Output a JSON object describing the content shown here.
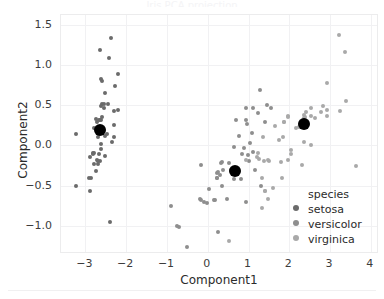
{
  "figure": {
    "title_sliver": "Iris PCA projection",
    "background": "#ffffff"
  },
  "axes": {
    "xlabel": "Component1",
    "ylabel": "Component2",
    "xticks": [
      "-3",
      "-2",
      "-1",
      "0",
      "1",
      "2",
      "3",
      "4"
    ],
    "xtick_values": [
      -3,
      -2,
      -1,
      0,
      1,
      2,
      3,
      4
    ],
    "yticks": [
      "1.5",
      "1.0",
      "0.5",
      "0.0",
      "-0.5",
      "-1.0"
    ],
    "ytick_values": [
      1.5,
      1.0,
      0.5,
      0.0,
      -0.5,
      -1.0
    ]
  },
  "legend": {
    "title": "species",
    "entries": [
      {
        "label": "setosa",
        "color": "#6b6b6b"
      },
      {
        "label": "versicolor",
        "color": "#8e8e8e"
      },
      {
        "label": "virginica",
        "color": "#a9a9a9"
      }
    ]
  },
  "chart_data": {
    "type": "scatter",
    "title": "",
    "xlabel": "Component1",
    "ylabel": "Component2",
    "xlim": [
      -3.6,
      4.2
    ],
    "ylim": [
      -1.35,
      1.62
    ],
    "grid": true,
    "legend_position": "lower right",
    "series": [
      {
        "name": "setosa",
        "color": "#6b6b6b",
        "marker_size": 4,
        "points": [
          [
            -2.68,
            0.32
          ],
          [
            -2.71,
            -0.18
          ],
          [
            -2.89,
            -0.14
          ],
          [
            -2.75,
            -0.32
          ],
          [
            -2.73,
            0.33
          ],
          [
            -2.28,
            0.74
          ],
          [
            -2.82,
            -0.09
          ],
          [
            -2.63,
            0.16
          ],
          [
            -2.89,
            -0.57
          ],
          [
            -2.67,
            -0.11
          ],
          [
            -2.51,
            0.65
          ],
          [
            -2.61,
            0.02
          ],
          [
            -2.79,
            -0.23
          ],
          [
            -3.22,
            -0.51
          ],
          [
            -2.64,
            1.19
          ],
          [
            -2.38,
            1.34
          ],
          [
            -2.62,
            0.82
          ],
          [
            -2.65,
            0.32
          ],
          [
            -2.2,
            0.89
          ],
          [
            -2.59,
            0.52
          ],
          [
            -2.31,
            0.43
          ],
          [
            -2.54,
            0.47
          ],
          [
            -3.22,
            0.14
          ],
          [
            -2.3,
            0.11
          ],
          [
            -2.36,
            0.04
          ],
          [
            -2.51,
            -0.13
          ],
          [
            -2.47,
            0.14
          ],
          [
            -2.59,
            0.35
          ],
          [
            -2.63,
            0.31
          ],
          [
            -2.65,
            -0.19
          ],
          [
            -2.69,
            -0.23
          ],
          [
            -2.2,
            0.44
          ],
          [
            -2.59,
            0.8
          ],
          [
            -2.42,
            1.09
          ],
          [
            -2.61,
            -0.05
          ],
          [
            -2.8,
            -0.1
          ],
          [
            -2.61,
            0.49
          ],
          [
            -2.79,
            0.21
          ],
          [
            -2.87,
            -0.41
          ],
          [
            -2.61,
            0.17
          ],
          [
            -2.71,
            0.29
          ],
          [
            -2.39,
            -0.95
          ],
          [
            -2.91,
            -0.41
          ],
          [
            -2.53,
            0.12
          ],
          [
            -2.31,
            0.25
          ],
          [
            -2.7,
            -0.19
          ],
          [
            -2.54,
            0.52
          ],
          [
            -2.82,
            -0.11
          ],
          [
            -2.45,
            0.52
          ],
          [
            -2.7,
            0.11
          ]
        ]
      },
      {
        "name": "versicolor",
        "color": "#8e8e8e",
        "marker_size": 4,
        "points": [
          [
            1.28,
            0.69
          ],
          [
            0.93,
            0.32
          ],
          [
            1.46,
            0.5
          ],
          [
            0.18,
            -0.68
          ],
          [
            1.09,
            0.15
          ],
          [
            0.64,
            -0.42
          ],
          [
            1.1,
            0.46
          ],
          [
            -0.75,
            -1.0
          ],
          [
            1.04,
            0.03
          ],
          [
            -0.01,
            -0.72
          ],
          [
            -0.51,
            -1.26
          ],
          [
            0.51,
            -0.22
          ],
          [
            0.26,
            -1.08
          ],
          [
            0.98,
            -0.12
          ],
          [
            -0.17,
            -0.25
          ],
          [
            0.93,
            0.47
          ],
          [
            0.66,
            -0.35
          ],
          [
            0.23,
            -0.4
          ],
          [
            0.94,
            -0.7
          ],
          [
            0.04,
            -0.54
          ],
          [
            1.12,
            -0.08
          ],
          [
            0.36,
            -0.21
          ],
          [
            1.3,
            -0.51
          ],
          [
            1.02,
            -0.2
          ],
          [
            0.76,
            0.12
          ],
          [
            0.95,
            0.26
          ],
          [
            1.4,
            0.29
          ],
          [
            1.54,
            0.47
          ],
          [
            0.84,
            -0.11
          ],
          [
            -0.16,
            -0.68
          ],
          [
            -0.1,
            -0.71
          ],
          [
            -0.19,
            -0.67
          ],
          [
            0.22,
            -0.34
          ],
          [
            1.17,
            -0.3
          ],
          [
            0.57,
            -0.3
          ],
          [
            0.7,
            0.32
          ],
          [
            1.22,
            0.4
          ],
          [
            0.81,
            -0.42
          ],
          [
            0.24,
            -0.33
          ],
          [
            0.16,
            -0.68
          ],
          [
            0.46,
            -0.67
          ],
          [
            0.89,
            -0.03
          ],
          [
            0.23,
            -0.41
          ],
          [
            -0.7,
            -1.01
          ],
          [
            0.36,
            -0.51
          ],
          [
            0.33,
            -0.22
          ],
          [
            0.37,
            -0.3
          ],
          [
            0.64,
            -0.02
          ],
          [
            -0.91,
            -0.75
          ],
          [
            0.3,
            -0.37
          ]
        ]
      },
      {
        "name": "virginica",
        "color": "#a9a9a9",
        "marker_size": 4,
        "points": [
          [
            2.53,
            0.01
          ],
          [
            1.41,
            -0.57
          ],
          [
            2.62,
            0.34
          ],
          [
            1.97,
            -0.18
          ],
          [
            2.35,
            0.04
          ],
          [
            3.4,
            0.55
          ],
          [
            0.52,
            -1.19
          ],
          [
            2.93,
            0.36
          ],
          [
            2.32,
            -0.24
          ],
          [
            2.92,
            0.78
          ],
          [
            1.66,
            0.24
          ],
          [
            1.8,
            -0.21
          ],
          [
            2.17,
            0.21
          ],
          [
            1.34,
            -0.78
          ],
          [
            1.59,
            -0.53
          ],
          [
            1.88,
            0.29
          ],
          [
            1.85,
            0.11
          ],
          [
            3.37,
            1.16
          ],
          [
            3.64,
            -0.26
          ],
          [
            1.48,
            -0.67
          ],
          [
            2.37,
            0.38
          ],
          [
            1.34,
            -0.41
          ],
          [
            3.25,
            0.43
          ],
          [
            1.26,
            -0.17
          ],
          [
            2.38,
            0.26
          ],
          [
            2.82,
            0.49
          ],
          [
            1.21,
            -0.15
          ],
          [
            1.23,
            -0.1
          ],
          [
            2.05,
            -0.06
          ],
          [
            2.36,
            0.34
          ],
          [
            2.93,
            0.44
          ],
          [
            3.22,
            1.37
          ],
          [
            2.04,
            -0.11
          ],
          [
            1.38,
            -0.2
          ],
          [
            1.83,
            -0.41
          ],
          [
            2.78,
            0.42
          ],
          [
            1.96,
            0.36
          ],
          [
            1.35,
            0.11
          ],
          [
            0.93,
            -0.18
          ],
          [
            2.39,
            0.35
          ],
          [
            2.54,
            0.36
          ],
          [
            2.24,
            0.23
          ],
          [
            1.41,
            -0.57
          ],
          [
            2.53,
            0.46
          ],
          [
            2.4,
            0.41
          ],
          [
            1.96,
            0.35
          ],
          [
            1.51,
            -0.2
          ],
          [
            1.74,
            0.07
          ],
          [
            1.86,
            0.29
          ],
          [
            1.47,
            -0.18
          ]
        ]
      },
      {
        "name": "centroids",
        "color": "#000000",
        "marker_size": 12,
        "points": [
          [
            -2.64,
            0.19
          ],
          [
            0.68,
            -0.32
          ],
          [
            2.35,
            0.26
          ]
        ]
      }
    ]
  }
}
